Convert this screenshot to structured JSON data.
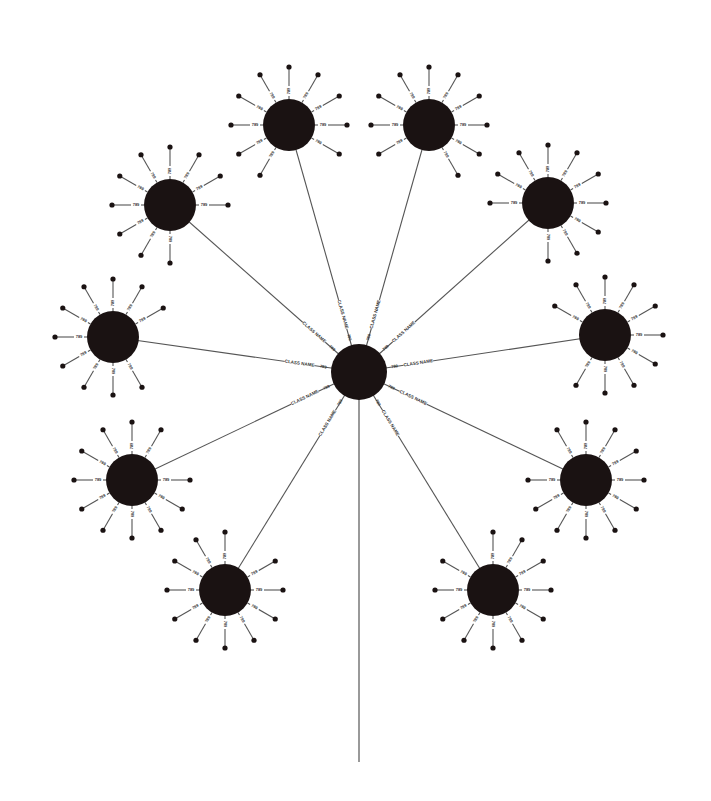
{
  "diagram": {
    "type": "radial-hub-spoke",
    "colors": {
      "node": "#1a1212",
      "line": "#555555",
      "background": "#ffffff",
      "text": "#333333"
    },
    "hub": {
      "x": 359,
      "y": 372,
      "r": 28,
      "spoke_label": "CLASS NAME",
      "port_label": "789"
    },
    "trunk": {
      "x": 359,
      "y_end": 762
    },
    "spoke_label_text": "789",
    "satellites": [
      {
        "id": "n1",
        "x": 289,
        "y": 125
      },
      {
        "id": "n2",
        "x": 429,
        "y": 125
      },
      {
        "id": "n3",
        "x": 170,
        "y": 205
      },
      {
        "id": "n4",
        "x": 548,
        "y": 203
      },
      {
        "id": "n5",
        "x": 113,
        "y": 337
      },
      {
        "id": "n6",
        "x": 605,
        "y": 335
      },
      {
        "id": "n7",
        "x": 132,
        "y": 480
      },
      {
        "id": "n8",
        "x": 586,
        "y": 480
      },
      {
        "id": "n9",
        "x": 225,
        "y": 590
      },
      {
        "id": "n10",
        "x": 493,
        "y": 590
      }
    ],
    "satellite_radius": 26,
    "spoke_length": 58
  }
}
